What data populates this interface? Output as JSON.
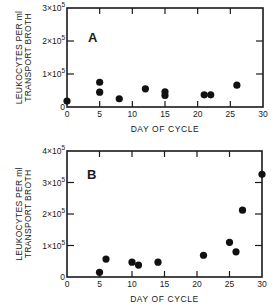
{
  "chart_data": [
    {
      "type": "scatter",
      "panel_label": "A",
      "title": "",
      "xlabel": "DAY OF CYCLE",
      "ylabel_line1": "LEUKOCYTES PER ml",
      "ylabel_line2": "TRANSPORT BROTH",
      "xlim": [
        0,
        30
      ],
      "ylim": [
        0,
        300000
      ],
      "x_ticks": [
        "0",
        "5",
        "10",
        "15",
        "20",
        "25",
        "30"
      ],
      "y_ticks": [
        {
          "value": 0,
          "label": "0"
        },
        {
          "value": 100000,
          "label": "1x10^5"
        },
        {
          "value": 200000,
          "label": "2x10^5"
        },
        {
          "value": 300000,
          "label": "3x10^5"
        }
      ],
      "grid": false,
      "points": [
        {
          "x": 0,
          "y": 18000
        },
        {
          "x": 5,
          "y": 75000
        },
        {
          "x": 5,
          "y": 45000
        },
        {
          "x": 8,
          "y": 25000
        },
        {
          "x": 12,
          "y": 55000
        },
        {
          "x": 15,
          "y": 46000
        },
        {
          "x": 15,
          "y": 35000
        },
        {
          "x": 21,
          "y": 37000
        },
        {
          "x": 22,
          "y": 37000
        },
        {
          "x": 26,
          "y": 66000
        }
      ]
    },
    {
      "type": "scatter",
      "panel_label": "B",
      "title": "",
      "xlabel": "DAY OF CYCLE",
      "ylabel_line1": "LEUKOCYTES PER ml",
      "ylabel_line2": "TRANSPORT BROTH",
      "xlim": [
        0,
        30
      ],
      "ylim": [
        0,
        400000
      ],
      "x_ticks": [
        "0",
        "5",
        "10",
        "15",
        "20",
        "25",
        "30"
      ],
      "y_ticks": [
        {
          "value": 0,
          "label": "0"
        },
        {
          "value": 100000,
          "label": "1x10^5"
        },
        {
          "value": 200000,
          "label": "2x10^5"
        },
        {
          "value": 300000,
          "label": "3x10^5"
        },
        {
          "value": 400000,
          "label": "4x10^5"
        }
      ],
      "grid": false,
      "points": [
        {
          "x": 5,
          "y": 15000
        },
        {
          "x": 6,
          "y": 57000
        },
        {
          "x": 10,
          "y": 47000
        },
        {
          "x": 11,
          "y": 38000
        },
        {
          "x": 14,
          "y": 47000
        },
        {
          "x": 21,
          "y": 69000
        },
        {
          "x": 25,
          "y": 110000
        },
        {
          "x": 26,
          "y": 80000
        },
        {
          "x": 27,
          "y": 212000
        },
        {
          "x": 30,
          "y": 326000
        }
      ]
    }
  ]
}
